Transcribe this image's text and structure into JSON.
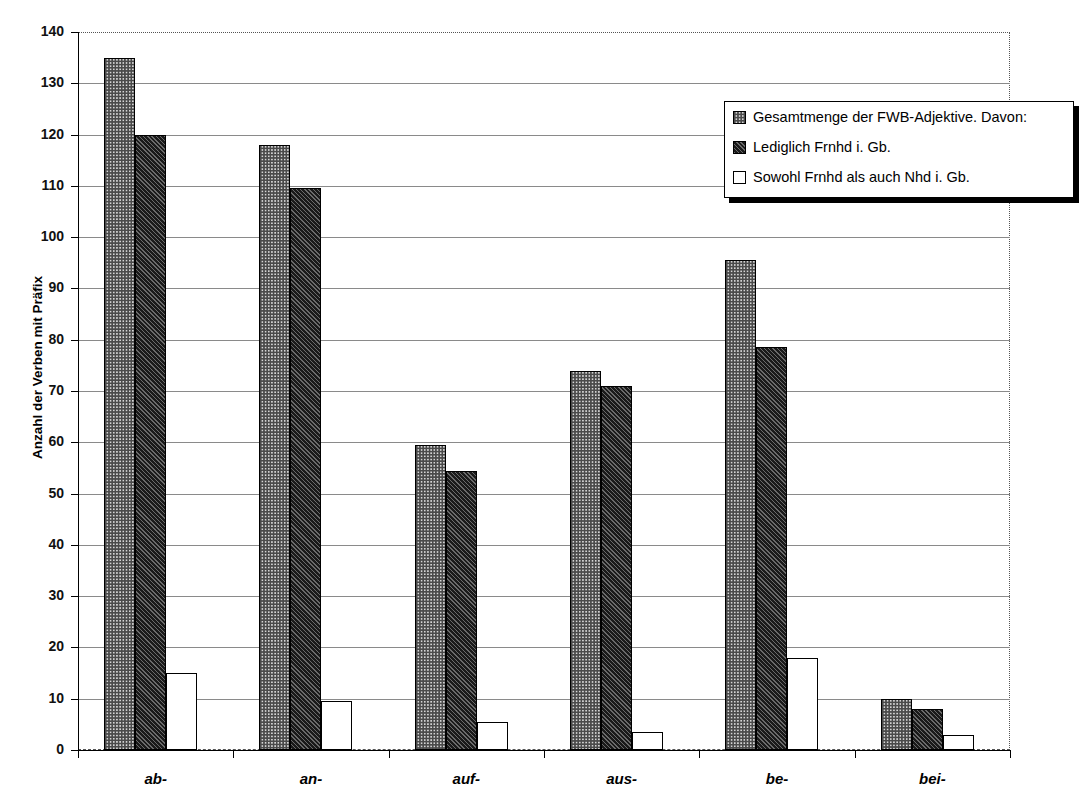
{
  "chart_data": {
    "type": "bar",
    "title": "",
    "xlabel": "",
    "ylabel": "Anzahl der Verben mit Präfix",
    "ylim": [
      0,
      140
    ],
    "ytick_step": 10,
    "yticks": [
      0,
      10,
      20,
      30,
      40,
      50,
      60,
      70,
      80,
      90,
      100,
      110,
      120,
      130,
      140
    ],
    "grid": true,
    "legend_position": "top-right",
    "categories": [
      "ab-",
      "an-",
      "auf-",
      "aus-",
      "be-",
      "bei-"
    ],
    "series": [
      {
        "name": "Gesamtmenge der FWB-Adjektive. Davon:",
        "pattern": "checkered-light",
        "color": "#d4d4d4",
        "values": [
          135,
          118,
          59.5,
          74,
          95.5,
          10
        ]
      },
      {
        "name": "Lediglich Frnhd i. Gb.",
        "pattern": "dark-hatch",
        "color": "#1a1a1a",
        "values": [
          120,
          109.5,
          54.5,
          71,
          78.5,
          8
        ]
      },
      {
        "name": "Sowohl Frnhd als auch Nhd i. Gb.",
        "pattern": "empty-white",
        "color": "#ffffff",
        "values": [
          15,
          9.5,
          5.5,
          3.5,
          18,
          3
        ]
      }
    ]
  },
  "legend": {
    "items": [
      {
        "label": "Gesamtmenge der FWB-Adjektive. Davon:"
      },
      {
        "label": "Lediglich Frnhd i. Gb."
      },
      {
        "label": "Sowohl Frnhd als auch Nhd i. Gb."
      }
    ]
  },
  "axis": {
    "y_title": "Anzahl der Verben mit Präfix"
  }
}
